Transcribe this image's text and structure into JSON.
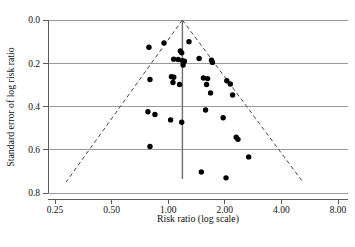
{
  "chart_data": {
    "type": "scatter",
    "title": "",
    "subtitle": "",
    "xlabel": "Risk ratio (log scale)",
    "ylabel": "Standard error of log risk ratio",
    "x_scale": "log2",
    "xticks": [
      0.25,
      0.5,
      1.0,
      2.0,
      4.0,
      8.0
    ],
    "xtick_labels": [
      "0.25",
      "0.50",
      "1.00",
      "2.00",
      "4.00",
      "8.00"
    ],
    "yticks": [
      0.0,
      0.2,
      0.4,
      0.6,
      0.8
    ],
    "ytick_labels": [
      "0.0",
      "0.2",
      "0.4",
      "0.6",
      "0.8"
    ],
    "xlim": [
      0.25,
      8.0
    ],
    "ylim": [
      0.0,
      0.8
    ],
    "y_inverted": true,
    "grid": "horizontal",
    "legend": "none",
    "annotations": {
      "reference_line_value": 1.19,
      "reference_line_label": "pooled effect vertical line",
      "funnel_edges_label": "95% pseudo confidence limits (dashed)"
    },
    "points": [
      {
        "rr": 0.79,
        "se": 0.126
      },
      {
        "rr": 0.95,
        "se": 0.106
      },
      {
        "rr": 1.29,
        "se": 0.1
      },
      {
        "rr": 1.16,
        "se": 0.143
      },
      {
        "rr": 1.18,
        "se": 0.152
      },
      {
        "rr": 1.07,
        "se": 0.181
      },
      {
        "rr": 1.13,
        "se": 0.183
      },
      {
        "rr": 1.19,
        "se": 0.188
      },
      {
        "rr": 1.22,
        "se": 0.191
      },
      {
        "rr": 1.2,
        "se": 0.208
      },
      {
        "rr": 1.46,
        "se": 0.178
      },
      {
        "rr": 1.7,
        "se": 0.186
      },
      {
        "rr": 1.72,
        "se": 0.196
      },
      {
        "rr": 0.8,
        "se": 0.275
      },
      {
        "rr": 1.04,
        "se": 0.262
      },
      {
        "rr": 1.07,
        "se": 0.265
      },
      {
        "rr": 1.06,
        "se": 0.289
      },
      {
        "rr": 1.15,
        "se": 0.298
      },
      {
        "rr": 1.54,
        "se": 0.268
      },
      {
        "rr": 1.62,
        "se": 0.271
      },
      {
        "rr": 1.6,
        "se": 0.298
      },
      {
        "rr": 2.05,
        "se": 0.281
      },
      {
        "rr": 2.14,
        "se": 0.296
      },
      {
        "rr": 1.68,
        "se": 0.337
      },
      {
        "rr": 2.2,
        "se": 0.347
      },
      {
        "rr": 0.78,
        "se": 0.424
      },
      {
        "rr": 0.85,
        "se": 0.437
      },
      {
        "rr": 1.03,
        "se": 0.462
      },
      {
        "rr": 1.18,
        "se": 0.473
      },
      {
        "rr": 1.58,
        "se": 0.416
      },
      {
        "rr": 1.96,
        "se": 0.452
      },
      {
        "rr": 2.3,
        "se": 0.542
      },
      {
        "rr": 2.35,
        "se": 0.552
      },
      {
        "rr": 0.8,
        "se": 0.585
      },
      {
        "rr": 2.68,
        "se": 0.633
      },
      {
        "rr": 1.5,
        "se": 0.703
      },
      {
        "rr": 2.03,
        "se": 0.73
      }
    ]
  },
  "axes": {
    "x_title": "Risk ratio (log scale)",
    "y_title": "Standard error of log risk ratio"
  }
}
